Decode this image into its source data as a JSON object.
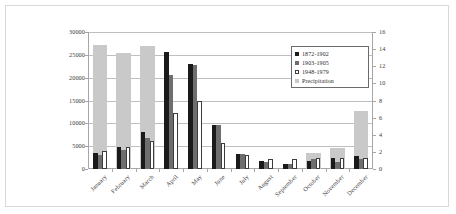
{
  "chart_data": {
    "type": "bar",
    "title": "",
    "subtitle": "",
    "xlabel": "",
    "ylabel": "",
    "categories": [
      "January",
      "February",
      "March",
      "April",
      "May",
      "June",
      "July",
      "August",
      "September",
      "October",
      "November",
      "December"
    ],
    "axes": {
      "left": {
        "label": "",
        "ylim": [
          0,
          30000
        ],
        "ticks": [
          0,
          5000,
          10000,
          15000,
          20000,
          25000,
          30000
        ],
        "tick_labels": [
          "0",
          "5000",
          "10000",
          "15000",
          "20000",
          "25000",
          "30000"
        ]
      },
      "right": {
        "label": "",
        "ylim": [
          0,
          16
        ],
        "ticks": [
          0,
          2,
          4,
          6,
          8,
          10,
          12,
          14,
          16
        ],
        "tick_labels": [
          "0",
          "2",
          "4",
          "6",
          "8",
          "10",
          "12",
          "14",
          "16"
        ]
      }
    },
    "grid": true,
    "legend_position": "upper-right-inside",
    "series": [
      {
        "name": "1872-1902",
        "axis": "left",
        "color": "#1a1a1a",
        "values": [
          3600,
          4900,
          8200,
          25700,
          23000,
          9700,
          3300,
          1700,
          1200,
          1800,
          2400,
          2800
        ]
      },
      {
        "name": "1903-1905",
        "axis": "left",
        "color": "#6e6e6e",
        "values": [
          3100,
          4100,
          6700,
          20600,
          22700,
          9700,
          3200,
          1500,
          1100,
          2100,
          1600,
          2100
        ]
      },
      {
        "name": "1948-1979",
        "axis": "left",
        "color": "#ffffff",
        "values": [
          4000,
          4900,
          6200,
          12200,
          15000,
          5800,
          3000,
          2200,
          2200,
          2300,
          2300,
          2400
        ]
      },
      {
        "name": "Precipitation",
        "axis": "right",
        "color": "#c9c9c9",
        "values": [
          14.5,
          13.5,
          14.4,
          4.9,
          0.4,
          0.0,
          0.0,
          0.0,
          0.0,
          1.9,
          2.4,
          6.8
        ]
      }
    ]
  }
}
